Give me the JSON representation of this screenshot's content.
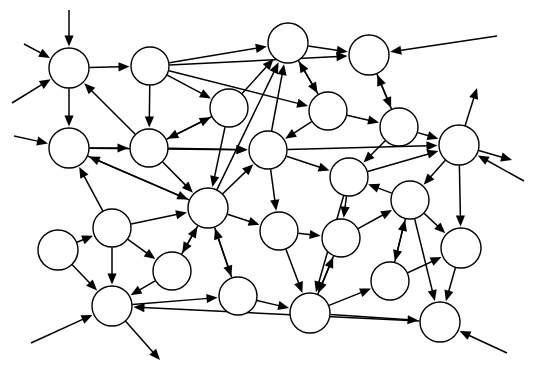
{
  "figure": {
    "title": "",
    "type": "directed-network-graph",
    "background_color": "#ffffff",
    "node_fill_color": "#ffffff",
    "node_stroke_color": "#000000",
    "edge_color": "#000000",
    "node_count": 22,
    "edge_count": 55,
    "external_arrow_count": 11,
    "width": 537,
    "height": 384
  },
  "chart_data": {
    "type": "diagram",
    "title": "",
    "xlabel": "",
    "ylabel": "",
    "nodes": [
      {
        "id": "n1",
        "label": "",
        "x": 69,
        "y": 68,
        "r": 20
      },
      {
        "id": "n2",
        "label": "",
        "x": 150,
        "y": 66,
        "r": 19
      },
      {
        "id": "n3",
        "label": "",
        "x": 288,
        "y": 43,
        "r": 20
      },
      {
        "id": "n4",
        "label": "",
        "x": 369,
        "y": 55,
        "r": 20
      },
      {
        "id": "n5",
        "label": "",
        "x": 229,
        "y": 108,
        "r": 19
      },
      {
        "id": "n6",
        "label": "",
        "x": 328,
        "y": 111,
        "r": 19
      },
      {
        "id": "n7",
        "label": "",
        "x": 399,
        "y": 127,
        "r": 19
      },
      {
        "id": "n8",
        "label": "",
        "x": 459,
        "y": 145,
        "r": 20
      },
      {
        "id": "n9",
        "label": "",
        "x": 69,
        "y": 148,
        "r": 20
      },
      {
        "id": "n10",
        "label": "",
        "x": 149,
        "y": 148,
        "r": 19
      },
      {
        "id": "n11",
        "label": "",
        "x": 268,
        "y": 150,
        "r": 19
      },
      {
        "id": "n12",
        "label": "",
        "x": 349,
        "y": 177,
        "r": 19
      },
      {
        "id": "n13",
        "label": "",
        "x": 410,
        "y": 200,
        "r": 19
      },
      {
        "id": "n14",
        "label": "",
        "x": 208,
        "y": 208,
        "r": 20
      },
      {
        "id": "n15",
        "label": "",
        "x": 279,
        "y": 231,
        "r": 19
      },
      {
        "id": "n16",
        "label": "",
        "x": 341,
        "y": 238,
        "r": 19
      },
      {
        "id": "n17",
        "label": "",
        "x": 461,
        "y": 248,
        "r": 20
      },
      {
        "id": "n18",
        "label": "",
        "x": 58,
        "y": 250,
        "r": 20
      },
      {
        "id": "n19",
        "label": "",
        "x": 112,
        "y": 228,
        "r": 19
      },
      {
        "id": "n20",
        "label": "",
        "x": 172,
        "y": 271,
        "r": 19
      },
      {
        "id": "n21",
        "label": "",
        "x": 390,
        "y": 281,
        "r": 19
      },
      {
        "id": "n22",
        "label": "",
        "x": 112,
        "y": 306,
        "r": 20
      },
      {
        "id": "n23",
        "label": "",
        "x": 238,
        "y": 296,
        "r": 19
      },
      {
        "id": "n24",
        "label": "",
        "x": 310,
        "y": 313,
        "r": 20
      },
      {
        "id": "n25",
        "label": "",
        "x": 440,
        "y": 322,
        "r": 20
      }
    ],
    "edges": [
      {
        "from": "n1",
        "to": "n2"
      },
      {
        "from": "n1",
        "to": "n9"
      },
      {
        "from": "n2",
        "to": "n3"
      },
      {
        "from": "n2",
        "to": "n5"
      },
      {
        "from": "n2",
        "to": "n6"
      },
      {
        "from": "n2",
        "to": "n10"
      },
      {
        "from": "n2",
        "to": "n4"
      },
      {
        "from": "n10",
        "to": "n1"
      },
      {
        "from": "n10",
        "to": "n5"
      },
      {
        "from": "n5",
        "to": "n10"
      },
      {
        "from": "n5",
        "to": "n3"
      },
      {
        "from": "n5",
        "to": "n14"
      },
      {
        "from": "n3",
        "to": "n4"
      },
      {
        "from": "n3",
        "to": "n6"
      },
      {
        "from": "n6",
        "to": "n3"
      },
      {
        "from": "n6",
        "to": "n11"
      },
      {
        "from": "n6",
        "to": "n7"
      },
      {
        "from": "n4",
        "to": "n7"
      },
      {
        "from": "n7",
        "to": "n4"
      },
      {
        "from": "n7",
        "to": "n8"
      },
      {
        "from": "n7",
        "to": "n12"
      },
      {
        "from": "n9",
        "to": "n10"
      },
      {
        "from": "n9",
        "to": "n14"
      },
      {
        "from": "n9",
        "to": "n11"
      },
      {
        "from": "n10",
        "to": "n11"
      },
      {
        "from": "n10",
        "to": "n14"
      },
      {
        "from": "n11",
        "to": "n3"
      },
      {
        "from": "n11",
        "to": "n8"
      },
      {
        "from": "n11",
        "to": "n15"
      },
      {
        "from": "n11",
        "to": "n12"
      },
      {
        "from": "n14",
        "to": "n9"
      },
      {
        "from": "n14",
        "to": "n11"
      },
      {
        "from": "n14",
        "to": "n15"
      },
      {
        "from": "n14",
        "to": "n20"
      },
      {
        "from": "n14",
        "to": "n23"
      },
      {
        "from": "n14",
        "to": "n3"
      },
      {
        "from": "n12",
        "to": "n8"
      },
      {
        "from": "n12",
        "to": "n16"
      },
      {
        "from": "n12",
        "to": "n24"
      },
      {
        "from": "n13",
        "to": "n12"
      },
      {
        "from": "n13",
        "to": "n17"
      },
      {
        "from": "n13",
        "to": "n21"
      },
      {
        "from": "n13",
        "to": "n25"
      },
      {
        "from": "n8",
        "to": "n13"
      },
      {
        "from": "n8",
        "to": "n17"
      },
      {
        "from": "n17",
        "to": "n25"
      },
      {
        "from": "n18",
        "to": "n19"
      },
      {
        "from": "n18",
        "to": "n22"
      },
      {
        "from": "n19",
        "to": "n22"
      },
      {
        "from": "n19",
        "to": "n20"
      },
      {
        "from": "n19",
        "to": "n14"
      },
      {
        "from": "n19",
        "to": "n9"
      },
      {
        "from": "n20",
        "to": "n22"
      },
      {
        "from": "n20",
        "to": "n14"
      },
      {
        "from": "n22",
        "to": "n23"
      },
      {
        "from": "n23",
        "to": "n14"
      },
      {
        "from": "n23",
        "to": "n24"
      },
      {
        "from": "n24",
        "to": "n16"
      },
      {
        "from": "n24",
        "to": "n21"
      },
      {
        "from": "n24",
        "to": "n25"
      },
      {
        "from": "n16",
        "to": "n24"
      },
      {
        "from": "n16",
        "to": "n13"
      },
      {
        "from": "n21",
        "to": "n13"
      },
      {
        "from": "n21",
        "to": "n17"
      },
      {
        "from": "n25",
        "to": "n22"
      },
      {
        "from": "n15",
        "to": "n16"
      },
      {
        "from": "n15",
        "to": "n24"
      }
    ],
    "external_arrows": [
      {
        "kind": "in",
        "from_x": 69,
        "from_y": 10,
        "to": "n1"
      },
      {
        "kind": "in",
        "from_x": 24,
        "from_y": 44,
        "to": "n1"
      },
      {
        "kind": "in",
        "from_x": 12,
        "from_y": 103,
        "to": "n1"
      },
      {
        "kind": "in",
        "from_x": 14,
        "from_y": 136,
        "to": "n9"
      },
      {
        "kind": "in",
        "from_x": 31,
        "from_y": 343,
        "to": "n22"
      },
      {
        "kind": "out",
        "from": "n22",
        "to_x": 160,
        "to_y": 360
      },
      {
        "kind": "out",
        "from": "n8",
        "to_x": 477,
        "to_y": 88
      },
      {
        "kind": "in",
        "from_x": 524,
        "from_y": 181,
        "to": "n8"
      },
      {
        "kind": "out",
        "from": "n8",
        "to_x": 512,
        "to_y": 160
      },
      {
        "kind": "in",
        "from_x": 507,
        "from_y": 353,
        "to": "n25"
      },
      {
        "kind": "in",
        "from_x": 497,
        "from_y": 36,
        "to": "n4"
      }
    ]
  }
}
